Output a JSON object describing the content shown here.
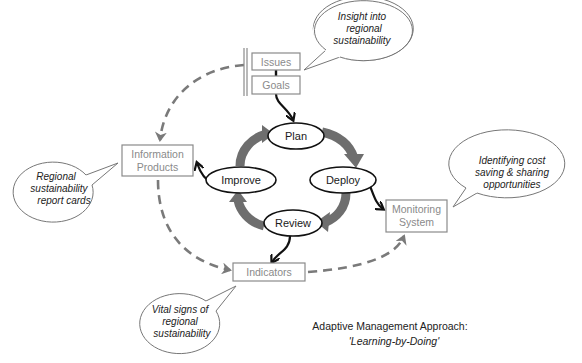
{
  "diagram": {
    "title": "Adaptive Management Approach:",
    "subtitle": "'Learning-by-Doing'",
    "inputs": {
      "issues": "Issues",
      "goals": "Goals"
    },
    "cycle": {
      "plan": "Plan",
      "deploy": "Deploy",
      "review": "Review",
      "improve": "Improve"
    },
    "outputs": {
      "information_products": [
        "Information",
        "Products"
      ],
      "monitoring_system": [
        "Monitoring",
        "System"
      ],
      "indicators": "Indicators"
    },
    "callouts": {
      "insight": [
        "Insight into",
        "regional",
        "sustainability"
      ],
      "report_cards": [
        "Regional",
        "sustainability",
        "report cards"
      ],
      "cost_saving": [
        "Identifying cost",
        "saving & sharing",
        "opportunities"
      ],
      "vital_signs": [
        "Vital signs of",
        "regional",
        "sustainability"
      ]
    },
    "colors": {
      "cycle_arrow": "#6e6e6e",
      "dashed_arrow": "#7a7a7a",
      "box_border": "#8a8a8a",
      "box_text": "#8a8a8a",
      "node_border": "#111111"
    }
  }
}
